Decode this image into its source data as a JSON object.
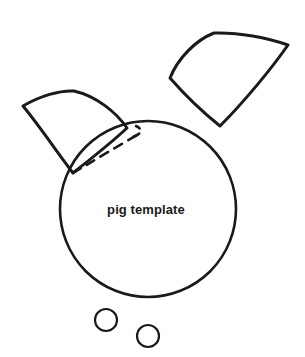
{
  "page": {
    "title": "pig template",
    "background_color": "#ffffff",
    "width": 305,
    "height": 357
  },
  "artwork": {
    "kind": "craft-cut-template",
    "subject": "pig",
    "stroke_color": "#1a1a1a",
    "fill_color": "none",
    "labels": {
      "body": "pig template"
    },
    "shapes": [
      {
        "name": "pig-head-circle",
        "type": "circle",
        "cx": 148,
        "cy": 209,
        "r": 88,
        "stroke_width": 2.6,
        "label": "pig template"
      },
      {
        "name": "pig-ear-right",
        "type": "closed-curve-quad",
        "stroke_width": 3.0,
        "points": [
          [
            170,
            78
          ],
          [
            214,
            33
          ],
          [
            288,
            45
          ],
          [
            220,
            126
          ]
        ]
      },
      {
        "name": "pig-ear-left",
        "type": "closed-curve-quad",
        "stroke_width": 3.0,
        "points": [
          [
            23,
            106
          ],
          [
            74,
            91
          ],
          [
            127,
            128
          ],
          [
            73,
            173
          ]
        ]
      },
      {
        "name": "pig-ear-left-fold-line",
        "type": "dashed-curve",
        "stroke_width": 2.6,
        "dash": "9 7",
        "points": [
          [
            73,
            173
          ],
          [
            101,
            155
          ],
          [
            139,
            134
          ]
        ]
      },
      {
        "name": "pig-ear-left-fold-hook",
        "type": "dashed-curve",
        "stroke_width": 2.6,
        "dash": "7 6",
        "points": [
          [
            139,
            134
          ],
          [
            142,
            130
          ],
          [
            136,
            126
          ]
        ]
      },
      {
        "name": "pig-nostril-left",
        "type": "circle",
        "cx": 106,
        "cy": 320,
        "r": 11,
        "stroke_width": 2.2
      },
      {
        "name": "pig-nostril-right",
        "type": "circle",
        "cx": 148,
        "cy": 336,
        "r": 11,
        "stroke_width": 2.2
      }
    ]
  }
}
